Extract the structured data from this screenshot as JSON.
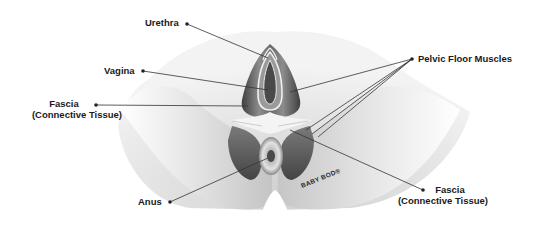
{
  "diagram": {
    "labels": {
      "urethra": "Urethra",
      "vagina": "Vagina",
      "fascia_left_line1": "Fascia",
      "fascia_left_line2": "(Connective Tissue)",
      "pelvic_floor_muscles": "Pelvic Floor Muscles",
      "anus": "Anus",
      "fascia_right_line1": "Fascia",
      "fascia_right_line2": "(Connective Tissue)"
    },
    "watermark": "BABY BOD®",
    "colors": {
      "background": "#ffffff",
      "skin_light": "#efefef",
      "skin_shadow": "#b9b9b9",
      "muscle_dark": "#5a5a5a",
      "muscle_mid": "#8a8a8a",
      "fascia_white": "#f4f4f4",
      "leader_line": "#333333",
      "label_text": "#1a1a1a"
    }
  }
}
